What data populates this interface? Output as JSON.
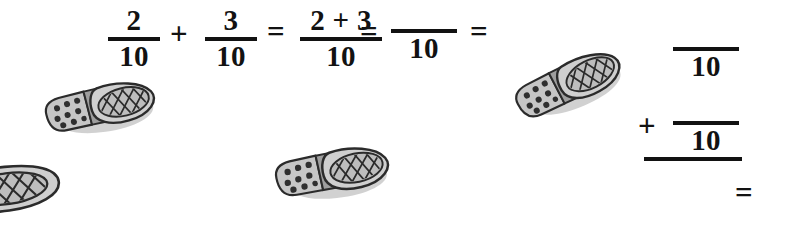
{
  "document": {
    "kind": "math-worksheet",
    "topic": "adding fractions with like denominators",
    "background_color": "#ffffff",
    "ink_color": "#121212"
  },
  "equation": {
    "line_label": "2/10 + 3/10 = (2+3)/10 = _/10 =",
    "terms": [
      {
        "id": "term1",
        "numerator": "2",
        "denominator": "10"
      },
      {
        "id": "plus1",
        "operator": "+"
      },
      {
        "id": "term2",
        "numerator": "3",
        "denominator": "10"
      },
      {
        "id": "equals1",
        "operator": "="
      },
      {
        "id": "term3",
        "numerator": "2 + 3",
        "denominator": "10"
      },
      {
        "id": "equals2",
        "operator": "="
      },
      {
        "id": "term4_blank",
        "numerator": "",
        "denominator": "10"
      },
      {
        "id": "equals3",
        "operator": "="
      }
    ]
  },
  "answer_frame": {
    "description": "blank vertical addition frame for the student to complete",
    "rows": [
      {
        "id": "answer_frac_1",
        "numerator": "",
        "denominator": "10",
        "operator": ""
      },
      {
        "id": "answer_frac_2",
        "numerator": "",
        "denominator": "10",
        "operator": "+"
      }
    ],
    "result": {
      "id": "answer_result",
      "operator": "="
    }
  },
  "illustrations": {
    "subject": "shoe-sole",
    "count": 4,
    "items": [
      {
        "id": "shoe-1",
        "label": "shoe sole illustration",
        "state": "whole",
        "rotation_deg": -8
      },
      {
        "id": "shoe-2",
        "label": "shoe sole illustration",
        "state": "whole",
        "rotation_deg": -6
      },
      {
        "id": "shoe-3",
        "label": "shoe sole illustration",
        "state": "whole",
        "rotation_deg": -21
      },
      {
        "id": "shoe-4",
        "label": "shoe sole illustration",
        "state": "cropped-at-left-edge",
        "rotation_deg": -8
      }
    ],
    "palette": {
      "outline": "#2b2b2b",
      "body_fill": "#cfcfcf",
      "heel_fill": "#c6c6c6",
      "toe_fill": "#bdbdbd",
      "stud": "#2f2f2f",
      "shadow": "#9a9a9a"
    }
  }
}
